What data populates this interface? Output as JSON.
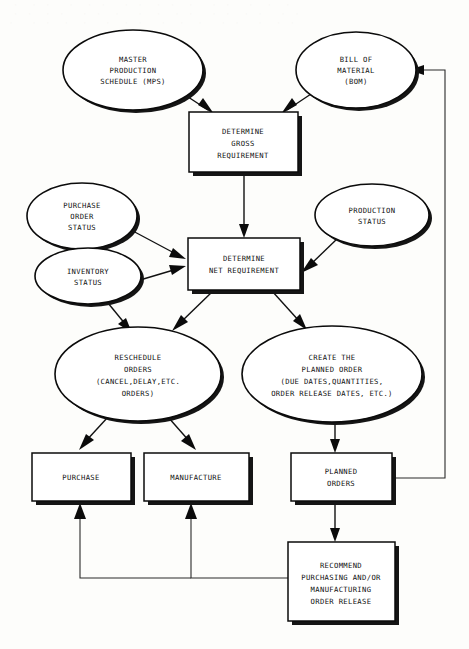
{
  "diagram": {
    "type": "flowchart",
    "background_color": "#fdfdfb",
    "line_color": "#0b0b0b",
    "text_color": "#111111",
    "nodes": [
      {
        "id": "mps",
        "shape": "ellipse",
        "name": "master-production-schedule",
        "lines": [
          "MASTER",
          "PRODUCTION",
          "SCHEDULE (MPS)"
        ],
        "cx": 133,
        "cy": 70,
        "rx": 70,
        "ry": 40
      },
      {
        "id": "bom",
        "shape": "ellipse",
        "name": "bill-of-material",
        "lines": [
          "BILL OF",
          "MATERIAL",
          "(BOM)"
        ],
        "cx": 356,
        "cy": 70,
        "rx": 60,
        "ry": 38
      },
      {
        "id": "gross",
        "shape": "rect",
        "name": "determine-gross-requirement",
        "lines": [
          "DETERMINE",
          "GROSS",
          "REQUIREMENT"
        ],
        "x": 189,
        "y": 112,
        "w": 109,
        "h": 60
      },
      {
        "id": "po-status",
        "shape": "ellipse",
        "name": "purchase-order-status",
        "lines": [
          "PURCHASE",
          "ORDER",
          "STATUS"
        ],
        "cx": 82,
        "cy": 216,
        "rx": 55,
        "ry": 33
      },
      {
        "id": "inventory",
        "shape": "ellipse",
        "name": "inventory-status",
        "lines": [
          "INVENTORY",
          "STATUS"
        ],
        "cx": 88,
        "cy": 276,
        "rx": 53,
        "ry": 28
      },
      {
        "id": "prod-status",
        "shape": "ellipse",
        "name": "production-status",
        "lines": [
          "PRODUCTION",
          "STATUS"
        ],
        "cx": 372,
        "cy": 215,
        "rx": 57,
        "ry": 31
      },
      {
        "id": "net",
        "shape": "rect",
        "name": "determine-net-requirement",
        "lines": [
          "DETERMINE",
          "NET REQUIREMENT"
        ],
        "x": 188,
        "y": 238,
        "w": 112,
        "h": 52
      },
      {
        "id": "reschedule",
        "shape": "ellipse",
        "name": "reschedule-orders",
        "lines": [
          "RESCHEDULE",
          "ORDERS",
          "(CANCEL,DELAY,ETC.",
          "ORDERS)"
        ],
        "cx": 138,
        "cy": 374,
        "rx": 83,
        "ry": 47
      },
      {
        "id": "create",
        "shape": "ellipse",
        "name": "create-the-planned-order",
        "lines": [
          "CREATE THE",
          "PLANNED ORDER",
          "(DUE DATES,QUANTITIES,",
          "ORDER RELEASE DATES, ETC.)"
        ],
        "cx": 332,
        "cy": 374,
        "rx": 90,
        "ry": 48
      },
      {
        "id": "purchase",
        "shape": "rect",
        "name": "purchase",
        "lines": [
          "PURCHASE"
        ],
        "x": 32,
        "y": 453,
        "w": 99,
        "h": 48
      },
      {
        "id": "manufacture",
        "shape": "rect",
        "name": "manufacture",
        "lines": [
          "MANUFACTURE"
        ],
        "x": 144,
        "y": 453,
        "w": 105,
        "h": 48
      },
      {
        "id": "planned-orders",
        "shape": "rect",
        "name": "planned-orders",
        "lines": [
          "PLANNED",
          "ORDERS"
        ],
        "x": 291,
        "y": 453,
        "w": 101,
        "h": 48
      },
      {
        "id": "recommend",
        "shape": "rect",
        "name": "recommend-order-release",
        "lines": [
          "RECOMMEND",
          "PURCHASING AND/OR",
          "MANUFACTURING",
          "ORDER RELEASE"
        ],
        "x": 288,
        "y": 542,
        "w": 107,
        "h": 79
      }
    ],
    "edges": [
      {
        "name": "mps-to-gross",
        "from": "mps",
        "to": "gross",
        "style": "arrow"
      },
      {
        "name": "bom-to-gross",
        "from": "bom",
        "to": "gross",
        "style": "arrow"
      },
      {
        "name": "gross-to-net",
        "from": "gross",
        "to": "net",
        "style": "arrow"
      },
      {
        "name": "po-status-to-net",
        "from": "po-status",
        "to": "net",
        "style": "arrow"
      },
      {
        "name": "inventory-to-net",
        "from": "inventory",
        "to": "net",
        "style": "arrow"
      },
      {
        "name": "prod-status-to-net",
        "from": "prod-status",
        "to": "net",
        "style": "arrow"
      },
      {
        "name": "inventory-to-reschedule",
        "from": "inventory",
        "to": "reschedule",
        "style": "arrow"
      },
      {
        "name": "net-to-reschedule",
        "from": "net",
        "to": "reschedule",
        "style": "arrow"
      },
      {
        "name": "net-to-create",
        "from": "net",
        "to": "create",
        "style": "arrow"
      },
      {
        "name": "reschedule-to-purchase",
        "from": "reschedule",
        "to": "purchase",
        "style": "arrow"
      },
      {
        "name": "reschedule-to-manufacture",
        "from": "reschedule",
        "to": "manufacture",
        "style": "arrow"
      },
      {
        "name": "create-to-planned-orders",
        "from": "create",
        "to": "planned-orders",
        "style": "arrow"
      },
      {
        "name": "planned-orders-to-recommend",
        "from": "planned-orders",
        "to": "recommend",
        "style": "arrow"
      },
      {
        "name": "planned-orders-to-bom-feedback",
        "from": "planned-orders",
        "to": "bom",
        "style": "orthogonal-arrow"
      },
      {
        "name": "recommend-to-manufacture",
        "from": "recommend",
        "to": "manufacture",
        "style": "orthogonal-arrow"
      },
      {
        "name": "recommend-to-purchase",
        "from": "recommend",
        "to": "purchase",
        "style": "orthogonal-arrow"
      }
    ]
  }
}
